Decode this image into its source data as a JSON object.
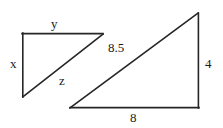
{
  "figure": {
    "name": "similar-right-triangles-diagram",
    "background_color": "#ffffff",
    "stroke_color": "#262626",
    "shapes": [
      {
        "name": "small-triangle",
        "type": "right-triangle",
        "vertices": {
          "top_left": [
            22,
            33
          ],
          "top_right": [
            103,
            34
          ],
          "bottom_left": [
            23,
            97
          ]
        },
        "sides": [
          {
            "name": "vertical-leg",
            "label": "x"
          },
          {
            "name": "horizontal-leg",
            "label": "y"
          },
          {
            "name": "hypotenuse",
            "label": "z"
          }
        ]
      },
      {
        "name": "large-triangle",
        "type": "right-triangle",
        "vertices": {
          "bottom_left": [
            70,
            108
          ],
          "bottom_right": [
            199,
            108
          ],
          "top_right": [
            198,
            13
          ]
        },
        "sides": [
          {
            "name": "hypotenuse",
            "label": "8.5"
          },
          {
            "name": "vertical-leg",
            "label": "4"
          },
          {
            "name": "horizontal-leg",
            "label": "8"
          }
        ]
      }
    ]
  },
  "labels": {
    "small_vertical_leg": "x",
    "small_horizontal_leg": "y",
    "small_hypotenuse": "z",
    "large_hypotenuse": "8.5",
    "large_vertical_leg": "4",
    "large_horizontal_leg": "8"
  }
}
